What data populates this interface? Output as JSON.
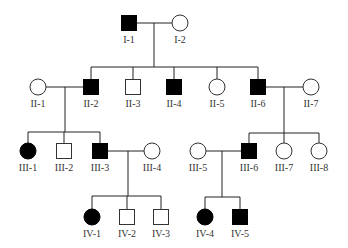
{
  "diagram": {
    "type": "pedigree",
    "colors": {
      "affected": "#000000",
      "unaffected": "#ffffff",
      "line": "#222222",
      "label": "#333333"
    },
    "symbol_size": 15,
    "individuals": [
      {
        "id": "I-1",
        "sex": "male",
        "affected": true,
        "x": 129,
        "y": 23
      },
      {
        "id": "I-2",
        "sex": "female",
        "affected": false,
        "x": 180,
        "y": 23
      },
      {
        "id": "II-1",
        "sex": "female",
        "affected": false,
        "x": 38,
        "y": 87
      },
      {
        "id": "II-2",
        "sex": "male",
        "affected": true,
        "x": 91,
        "y": 87
      },
      {
        "id": "II-3",
        "sex": "male",
        "affected": false,
        "x": 133,
        "y": 87
      },
      {
        "id": "II-4",
        "sex": "male",
        "affected": true,
        "x": 174,
        "y": 87
      },
      {
        "id": "II-5",
        "sex": "female",
        "affected": false,
        "x": 217,
        "y": 87
      },
      {
        "id": "II-6",
        "sex": "male",
        "affected": true,
        "x": 258,
        "y": 87
      },
      {
        "id": "II-7",
        "sex": "female",
        "affected": false,
        "x": 311,
        "y": 87
      },
      {
        "id": "III-1",
        "sex": "female",
        "affected": true,
        "x": 28,
        "y": 151
      },
      {
        "id": "III-2",
        "sex": "male",
        "affected": false,
        "x": 64,
        "y": 151
      },
      {
        "id": "III-3",
        "sex": "male",
        "affected": true,
        "x": 100,
        "y": 151
      },
      {
        "id": "III-4",
        "sex": "female",
        "affected": false,
        "x": 152,
        "y": 151
      },
      {
        "id": "III-5",
        "sex": "female",
        "affected": false,
        "x": 198,
        "y": 151
      },
      {
        "id": "III-6",
        "sex": "male",
        "affected": true,
        "x": 249,
        "y": 151
      },
      {
        "id": "III-7",
        "sex": "female",
        "affected": false,
        "x": 284,
        "y": 151
      },
      {
        "id": "III-8",
        "sex": "female",
        "affected": false,
        "x": 319,
        "y": 151
      },
      {
        "id": "IV-1",
        "sex": "female",
        "affected": true,
        "x": 92,
        "y": 217
      },
      {
        "id": "IV-2",
        "sex": "male",
        "affected": false,
        "x": 127,
        "y": 217
      },
      {
        "id": "IV-3",
        "sex": "male",
        "affected": false,
        "x": 161,
        "y": 217
      },
      {
        "id": "IV-4",
        "sex": "female",
        "affected": true,
        "x": 205,
        "y": 217
      },
      {
        "id": "IV-5",
        "sex": "male",
        "affected": true,
        "x": 240,
        "y": 217
      }
    ],
    "families": [
      {
        "parents": [
          "I-1",
          "I-2"
        ],
        "drop_x": 154,
        "sib_y": 67,
        "children": [
          "II-2",
          "II-3",
          "II-4",
          "II-5",
          "II-6"
        ]
      },
      {
        "parents": [
          "II-1",
          "II-2"
        ],
        "drop_x": 65,
        "sib_y": 132,
        "children": [
          "III-1",
          "III-2",
          "III-3"
        ]
      },
      {
        "parents": [
          "II-6",
          "II-7"
        ],
        "drop_x": 284,
        "sib_y": 133,
        "children": [
          "III-6",
          "III-7",
          "III-8"
        ]
      },
      {
        "parents": [
          "III-3",
          "III-4"
        ],
        "drop_x": 128,
        "sib_y": 196,
        "children": [
          "IV-1",
          "IV-2",
          "IV-3"
        ]
      },
      {
        "parents": [
          "III-5",
          "III-6"
        ],
        "drop_x": 222,
        "sib_y": 197,
        "children": [
          "IV-4",
          "IV-5"
        ]
      }
    ],
    "label_offset_y": 20
  }
}
